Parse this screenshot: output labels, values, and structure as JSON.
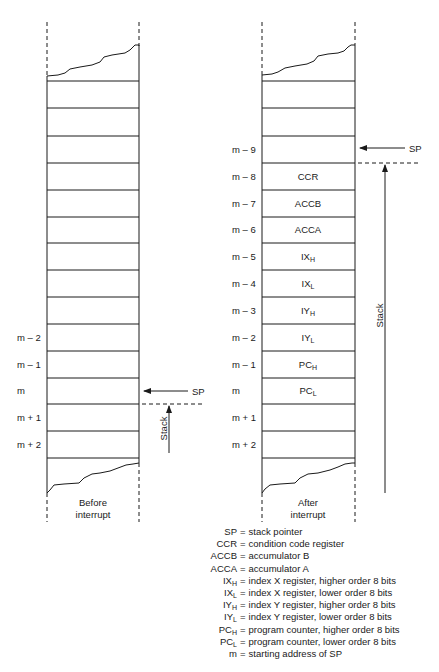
{
  "diagram": {
    "before": {
      "caption_line1": "Before",
      "caption_line2": "interrupt",
      "addresses": [
        {
          "label": "m – 2",
          "row": 9
        },
        {
          "label": "m – 1",
          "row": 10
        },
        {
          "label": "m",
          "row": 11
        },
        {
          "label": "m + 1",
          "row": 12
        },
        {
          "label": "m + 2",
          "row": 13
        }
      ],
      "sp_label": "SP",
      "stack_label": "Stack"
    },
    "after": {
      "caption_line1": "After",
      "caption_line2": "interrupt",
      "addresses": [
        {
          "label": "m – 9",
          "row": 2
        },
        {
          "label": "m – 8",
          "row": 3
        },
        {
          "label": "m – 7",
          "row": 4
        },
        {
          "label": "m – 6",
          "row": 5
        },
        {
          "label": "m – 5",
          "row": 6
        },
        {
          "label": "m – 4",
          "row": 7
        },
        {
          "label": "m – 3",
          "row": 8
        },
        {
          "label": "m – 2",
          "row": 9
        },
        {
          "label": "m – 1",
          "row": 10
        },
        {
          "label": "m",
          "row": 11
        },
        {
          "label": "m + 1",
          "row": 12
        },
        {
          "label": "m + 2",
          "row": 13
        }
      ],
      "cells": [
        {
          "base": "CCR",
          "sub": "",
          "row": 3
        },
        {
          "base": "ACCB",
          "sub": "",
          "row": 4
        },
        {
          "base": "ACCA",
          "sub": "",
          "row": 5
        },
        {
          "base": "IX",
          "sub": "H",
          "row": 6
        },
        {
          "base": "IX",
          "sub": "L",
          "row": 7
        },
        {
          "base": "IY",
          "sub": "H",
          "row": 8
        },
        {
          "base": "IY",
          "sub": "L",
          "row": 9
        },
        {
          "base": "PC",
          "sub": "H",
          "row": 10
        },
        {
          "base": "PC",
          "sub": "L",
          "row": 11
        }
      ],
      "sp_label": "SP",
      "stack_label": "Stack"
    },
    "legend": [
      {
        "key": "SP",
        "sub": "",
        "desc": "stack pointer"
      },
      {
        "key": "CCR",
        "sub": "",
        "desc": "condition code register"
      },
      {
        "key": "ACCB",
        "sub": "",
        "desc": "accumulator B"
      },
      {
        "key": "ACCA",
        "sub": "",
        "desc": "accumulator A"
      },
      {
        "key": "IX",
        "sub": "H",
        "desc": "index X register, higher order 8 bits"
      },
      {
        "key": "IX",
        "sub": "L",
        "desc": "index X register, lower order 8 bits"
      },
      {
        "key": "IY",
        "sub": "H",
        "desc": "index Y register, higher order 8 bits"
      },
      {
        "key": "IY",
        "sub": "L",
        "desc": "index Y register, lower order 8 bits"
      },
      {
        "key": "PC",
        "sub": "H",
        "desc": "program counter, higher order 8 bits"
      },
      {
        "key": "PC",
        "sub": "L",
        "desc": "program counter, lower order 8 bits"
      },
      {
        "key": "m",
        "sub": "",
        "desc": "starting address of SP"
      }
    ],
    "legend_eq": "="
  }
}
